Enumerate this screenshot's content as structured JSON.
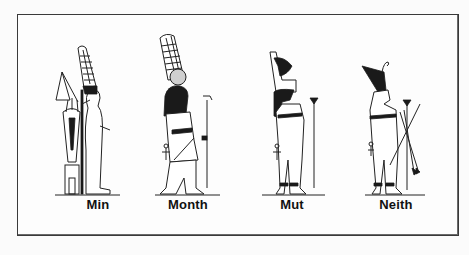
{
  "illustration": {
    "subject": "Egyptian deities",
    "figures": [
      {
        "name": "Min",
        "attributes": [
          "double-plume crown",
          "flail raised",
          "lettuce shrine"
        ]
      },
      {
        "name": "Month",
        "attributes": [
          "falcon head",
          "sun disk",
          "double plumes",
          "ankh",
          "was-sceptre"
        ]
      },
      {
        "name": "Mut",
        "attributes": [
          "double crown",
          "vulture headdress",
          "ankh",
          "papyrus sceptre"
        ]
      },
      {
        "name": "Neith",
        "attributes": [
          "red crown",
          "crossed arrows",
          "bow",
          "papyrus sceptre",
          "ankh"
        ]
      }
    ]
  }
}
